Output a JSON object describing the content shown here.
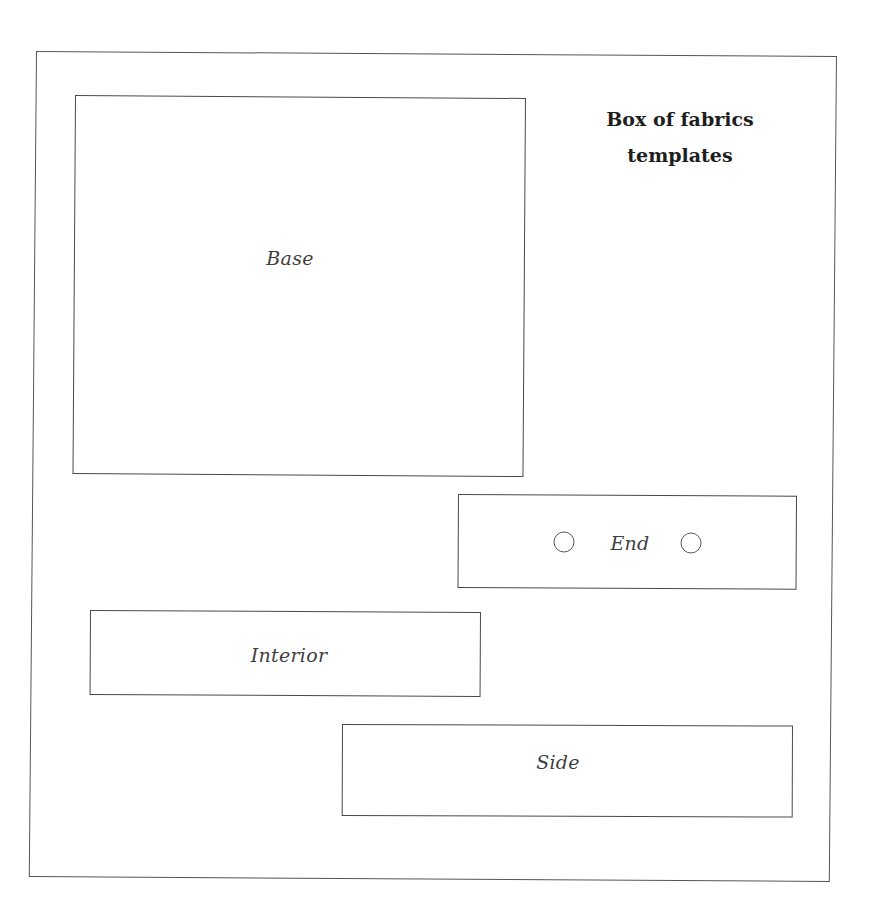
{
  "title": {
    "line1": "Box of fabrics",
    "line2": "templates"
  },
  "pieces": {
    "base": {
      "label": "Base"
    },
    "end": {
      "label": "End",
      "holes": 2
    },
    "interior": {
      "label": "Interior"
    },
    "side": {
      "label": "Side"
    }
  },
  "colors": {
    "line": "#4a4a4a",
    "text": "#3f3f3f",
    "title": "#1e1e1e",
    "background": "#ffffff"
  }
}
